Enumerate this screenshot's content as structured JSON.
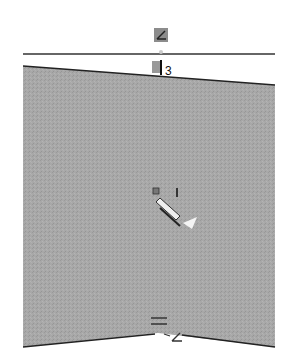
{
  "canvas": {
    "width": 292,
    "height": 355,
    "background": "#ffffff"
  },
  "colors": {
    "face_fill": "#a6a6a6",
    "edge_stroke": "#333333",
    "icon_fill": "#8c8c8c",
    "icon_dark": "#222222",
    "highlight": "#eeeeee"
  },
  "annotations": {
    "top_constraint_label": "3",
    "center_dimension_label": "1"
  },
  "relations": {
    "top_icon": "angle-constraint",
    "top_sub_icon": "vertical-constraint",
    "center_icon": "sketch-pencil",
    "bottom_icons": [
      "equal-constraint",
      "angle-constraint"
    ]
  }
}
